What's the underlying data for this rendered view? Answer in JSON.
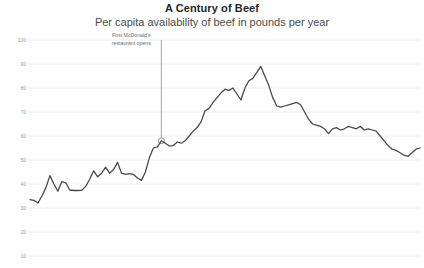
{
  "chart_data": {
    "type": "line",
    "title": "A Century of Beef",
    "subtitle": "Per capita availability of beef in pounds per year",
    "xlabel": "",
    "ylabel": "",
    "ylim": [
      0,
      100
    ],
    "yticks": [
      10,
      20,
      30,
      40,
      50,
      60,
      70,
      80,
      90,
      100
    ],
    "grid": true,
    "legend": false,
    "series_color": "#4a4a4a",
    "gridline_color": "#f0f0f0",
    "annotations": [
      {
        "label_line1": "First McDonald's",
        "label_line2": "restaurant opens",
        "marker_value": 58,
        "marker_index": 33,
        "line_color": "#a6a6a6"
      }
    ],
    "x": [
      0,
      1,
      2,
      3,
      4,
      5,
      6,
      7,
      8,
      9,
      10,
      11,
      12,
      13,
      14,
      15,
      16,
      17,
      18,
      19,
      20,
      21,
      22,
      23,
      24,
      25,
      26,
      27,
      28,
      29,
      30,
      31,
      32,
      33,
      34,
      35,
      36,
      37,
      38,
      39,
      40,
      41,
      42,
      43,
      44,
      45,
      46,
      47,
      48,
      49,
      50,
      51,
      52,
      53,
      54,
      55,
      56,
      57,
      58,
      59,
      60,
      61,
      62,
      63,
      64,
      65,
      66,
      67,
      68,
      69,
      70,
      71,
      72,
      73,
      74,
      75,
      76,
      77,
      78,
      79,
      80,
      81,
      82,
      83,
      84,
      85,
      86,
      87,
      88,
      89,
      90,
      91,
      92,
      93,
      94,
      95,
      96,
      97,
      98
    ],
    "values": [
      33.5,
      33.2,
      32.1,
      35.0,
      38.5,
      43.5,
      40.0,
      37.0,
      41.0,
      40.5,
      37.5,
      37.3,
      37.3,
      37.4,
      39.0,
      42.0,
      45.5,
      43.0,
      44.5,
      47.0,
      44.5,
      46.0,
      49.0,
      44.5,
      44.0,
      44.3,
      44.0,
      42.5,
      41.5,
      45.0,
      51.0,
      55.0,
      55.5,
      58.0,
      57.0,
      55.8,
      56.0,
      57.5,
      57.0,
      58.0,
      60.0,
      62.0,
      63.5,
      66.0,
      70.5,
      71.5,
      74.0,
      76.0,
      78.0,
      79.5,
      79.0,
      80.0,
      77.5,
      75.0,
      80.0,
      83.0,
      84.0,
      86.5,
      89.0,
      85.0,
      81.0,
      76.0,
      72.5,
      72.0,
      72.5,
      73.0,
      73.5,
      74.0,
      73.0,
      70.0,
      67.0,
      65.0,
      64.5,
      64.0,
      63.0,
      61.0,
      63.0,
      63.5,
      62.5,
      63.0,
      64.0,
      63.5,
      63.0,
      64.0,
      62.5,
      63.0,
      62.5,
      62.0,
      60.0,
      58.0,
      56.0,
      54.5,
      54.0,
      53.0,
      52.0,
      51.5,
      53.0,
      54.5,
      55.0
    ]
  }
}
